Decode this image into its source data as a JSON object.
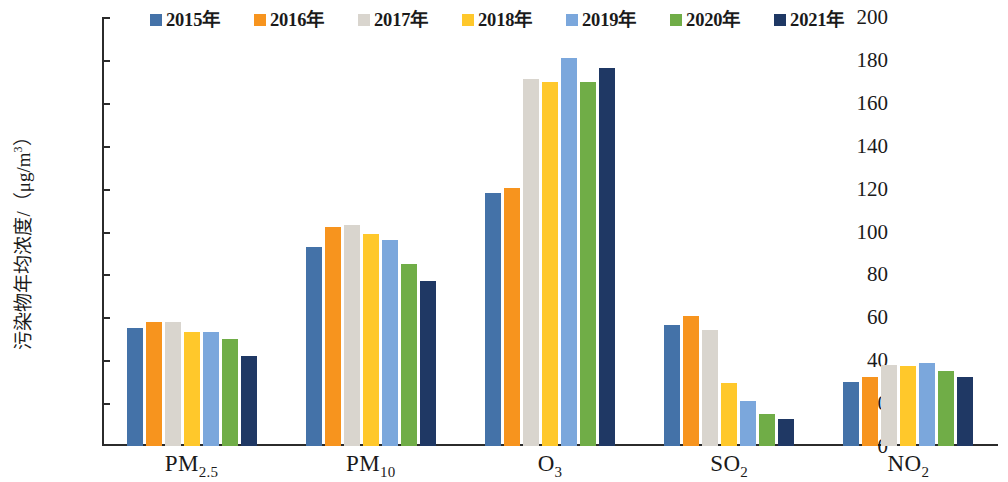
{
  "chart_data": {
    "type": "bar",
    "title": "",
    "xlabel": "",
    "ylabel": "污染物年均浓度/（μg/m³）",
    "ylim": [
      0,
      200
    ],
    "ytick_step": 20,
    "yticks": [
      0,
      20,
      40,
      60,
      80,
      100,
      120,
      140,
      160,
      180,
      200
    ],
    "grid": false,
    "legend_position": "top",
    "categories": [
      "PM2.5",
      "PM10",
      "O3",
      "SO2",
      "NO2"
    ],
    "category_labels": [
      {
        "base": "PM",
        "sub": "2.5"
      },
      {
        "base": "PM",
        "sub": "10"
      },
      {
        "base": "O",
        "sub": "3"
      },
      {
        "base": "SO",
        "sub": "2"
      },
      {
        "base": "NO",
        "sub": "2"
      }
    ],
    "series": [
      {
        "name": "2015年",
        "color": "#4472A8",
        "values": [
          55,
          93,
          118,
          56.5,
          30
        ]
      },
      {
        "name": "2016年",
        "color": "#F7941E",
        "values": [
          58,
          102,
          120.5,
          60.5,
          32
        ]
      },
      {
        "name": "2017年",
        "color": "#D9D5CE",
        "values": [
          58,
          103,
          171,
          54,
          38
        ]
      },
      {
        "name": "2018年",
        "color": "#FFC82B",
        "values": [
          53,
          99,
          169.5,
          29.5,
          37.5
        ]
      },
      {
        "name": "2019年",
        "color": "#7BA7DC",
        "values": [
          53,
          96,
          181,
          21,
          38.5
        ]
      },
      {
        "name": "2020年",
        "color": "#70AD47",
        "values": [
          50,
          85,
          169.5,
          15,
          35
        ]
      },
      {
        "name": "2021年",
        "color": "#1F3864",
        "values": [
          42,
          77,
          176,
          12.5,
          32
        ]
      }
    ]
  },
  "axis": {
    "line_color": "#2b2b2b"
  }
}
